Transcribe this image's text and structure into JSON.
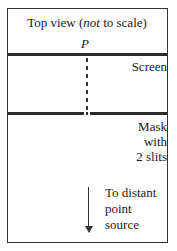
{
  "diagram": {
    "title_prefix": "Top view (",
    "title_italic": "not",
    "title_suffix": " to scale)",
    "point_label": "P",
    "screen_label": "Screen",
    "mask_label_lines": [
      "Mask",
      "with",
      "2 slits"
    ],
    "source_label_lines": [
      "To distant",
      "point",
      "source"
    ]
  }
}
